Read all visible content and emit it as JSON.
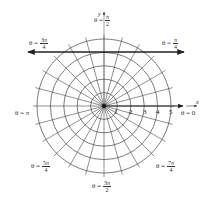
{
  "diagram": {
    "center": {
      "x": 104,
      "y": 106
    },
    "unit_px": 13.4,
    "circles": [
      1,
      2,
      3,
      4,
      5
    ],
    "ray_step_degrees": 15,
    "ray_extent": 5.3,
    "axes": {
      "x_label": "x",
      "y_label": "y"
    },
    "radius_ticks": [
      "1",
      "2",
      "3",
      "4",
      "5"
    ],
    "bold_line": {
      "description": "horizontal line with arrows",
      "y_px": 52,
      "x_start_px": 28,
      "x_end_px": 184
    },
    "colors": {
      "grid": "#444444",
      "bold": "#222222",
      "text": "#333333"
    }
  },
  "angle_labels": {
    "zero": {
      "prefix": "θ = 0"
    },
    "pi_4": {
      "prefix": "θ =",
      "num": "π",
      "den": "4"
    },
    "pi_2": {
      "prefix": "θ =",
      "num": "π",
      "den": "2"
    },
    "3pi_4": {
      "prefix": "θ =",
      "num": "3π",
      "den": "4"
    },
    "pi": {
      "prefix": "θ = π"
    },
    "5pi_4": {
      "prefix": "θ =",
      "num": "5π",
      "den": "4"
    },
    "3pi_2": {
      "prefix": "θ =",
      "num": "3π",
      "den": "2"
    },
    "7pi_4": {
      "prefix": "θ =",
      "num": "7π",
      "den": "4"
    }
  }
}
